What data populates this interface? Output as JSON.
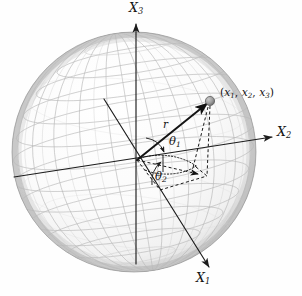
{
  "figure": {
    "background_color": "#fefefe",
    "ink_color": "#141414",
    "grid_color": "#b9b9b9",
    "shade_color": "#a8a8a8"
  },
  "labels": {
    "axis_x3": {
      "base": "X",
      "sub": "3"
    },
    "axis_x2": {
      "base": "X",
      "sub": "2"
    },
    "axis_x1": {
      "base": "X",
      "sub": "1"
    },
    "radius": "r",
    "theta1": {
      "base": "θ",
      "sub": "1"
    },
    "theta2": {
      "base": "θ",
      "sub": "2"
    },
    "point": {
      "open": "(",
      "x1": "x",
      "x1sub": "1",
      "sep1": ", ",
      "x2": "x",
      "x2sub": "2",
      "sep2": ", ",
      "x3": "x",
      "x3sub": "3",
      "close": ")"
    }
  },
  "geometry": {
    "sphere_center_x": 134,
    "sphere_center_y": 152,
    "sphere_radius_x": 122,
    "sphere_radius_y": 120,
    "origin_x": 137,
    "origin_y": 160,
    "point_x": 210,
    "point_y": 101,
    "point_marker_radius": 4.6,
    "projection_x": 205,
    "projection_y": 175
  },
  "icons": {
    "point_marker": "sphere-dot-icon",
    "arrowhead": "arrow-head-icon"
  }
}
